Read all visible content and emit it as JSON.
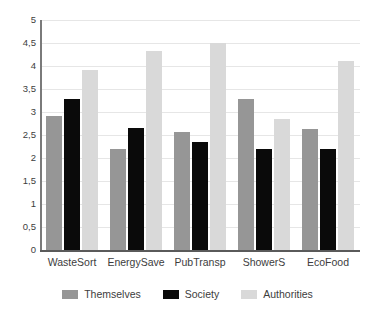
{
  "chart_data": {
    "type": "bar",
    "title": "",
    "subtitle": "",
    "xlabel": "",
    "ylabel": "",
    "ylim": [
      0,
      5
    ],
    "ytick_labels": [
      "5",
      "4,5",
      "4",
      "3,5",
      "3",
      "2,5",
      "2",
      "1,5",
      "1",
      "0,5",
      "0"
    ],
    "ytick_values": [
      5,
      4.5,
      4,
      3.5,
      3,
      2.5,
      2,
      1.5,
      1,
      0.5,
      0
    ],
    "grid": true,
    "grid_axis": "y",
    "legend_position": "bottom",
    "categories": [
      "WasteSort",
      "EnergySave",
      "PubTransp",
      "ShowerS",
      "EcoFood"
    ],
    "series": [
      {
        "name": "Themselves",
        "color": "#969696",
        "values": [
          2.92,
          2.2,
          2.57,
          3.28,
          2.62
        ]
      },
      {
        "name": "Society",
        "color": "#0a0a0a",
        "values": [
          3.28,
          2.65,
          2.35,
          2.2,
          2.2
        ]
      },
      {
        "name": "Authorities",
        "color": "#d9d9d9",
        "values": [
          3.92,
          4.33,
          4.5,
          2.85,
          4.1
        ]
      }
    ]
  },
  "legend": {
    "items": [
      {
        "label": "Themselves",
        "swatch": "themselves"
      },
      {
        "label": "Society",
        "swatch": "society"
      },
      {
        "label": "Authorities",
        "swatch": "authorities"
      }
    ]
  }
}
